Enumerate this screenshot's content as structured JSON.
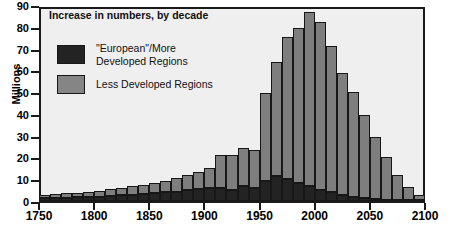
{
  "chart_data": {
    "type": "bar",
    "title": "Increase in numbers, by decade",
    "xlabel": "",
    "ylabel": "Millions",
    "xlim": [
      1750,
      2100
    ],
    "ylim": [
      0,
      90
    ],
    "xticks": [
      1750,
      1800,
      1850,
      1900,
      1950,
      2000,
      2050,
      2100
    ],
    "yticks": [
      0,
      10,
      20,
      30,
      40,
      50,
      60,
      70,
      80,
      90
    ],
    "grid": false,
    "stacked": true,
    "legend_position": "upper-left-inside",
    "categories": [
      1750,
      1760,
      1770,
      1780,
      1790,
      1800,
      1810,
      1820,
      1830,
      1840,
      1850,
      1860,
      1870,
      1880,
      1890,
      1900,
      1910,
      1920,
      1930,
      1940,
      1950,
      1960,
      1970,
      1980,
      1990,
      2000,
      2010,
      2020,
      2030,
      2040,
      2050,
      2060,
      2070,
      2080,
      2090
    ],
    "series": [
      {
        "name": "\"European\"/More Developed Regions",
        "color": "#232323",
        "values": [
          1.4,
          1.5,
          1.6,
          1.7,
          1.9,
          2.1,
          2.4,
          2.7,
          3.0,
          3.3,
          3.6,
          4.0,
          4.4,
          5.0,
          5.6,
          6.3,
          6.0,
          5.2,
          7.0,
          6.0,
          9.5,
          11.5,
          10.5,
          8.5,
          7.0,
          5.0,
          4.0,
          3.0,
          2.0,
          1.4,
          1.0,
          0.7,
          0.4,
          0.2,
          0.1
        ]
      },
      {
        "name": "Less Developed Regions",
        "color": "#7e7e7e",
        "values": [
          1.6,
          1.8,
          2.0,
          2.2,
          2.5,
          2.8,
          3.1,
          3.5,
          3.9,
          4.4,
          5.0,
          5.5,
          6.2,
          7.0,
          8.0,
          9.0,
          15.5,
          16.5,
          18.0,
          18.0,
          41.0,
          53.5,
          66.5,
          72.5,
          81.5,
          79.0,
          68.5,
          57.0,
          49.0,
          39.0,
          29.0,
          20.0,
          12.0,
          6.5,
          2.5
        ]
      }
    ],
    "totals": [
      3.0,
      3.3,
      3.6,
      3.9,
      4.4,
      4.9,
      5.5,
      6.2,
      6.9,
      7.7,
      8.6,
      9.5,
      10.6,
      12.0,
      13.6,
      15.3,
      21.5,
      21.7,
      25.0,
      24.0,
      50.5,
      65.0,
      77.0,
      81.0,
      88.5,
      84.0,
      72.5,
      60.0,
      51.0,
      40.4,
      30.0,
      20.7,
      12.4,
      6.7,
      2.6
    ]
  },
  "legend": {
    "items": [
      {
        "label": "\"European\"/More\nDeveloped Regions",
        "swatch": "dev"
      },
      {
        "label": "Less Developed Regions",
        "swatch": "less"
      }
    ]
  }
}
